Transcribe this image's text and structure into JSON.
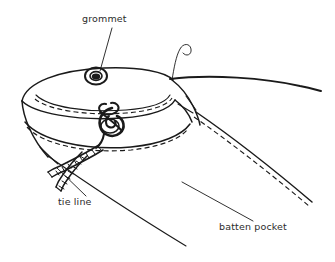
{
  "figure": {
    "name": "sail-batten-pocket-detail",
    "background_color": "#ffffff",
    "ink_color": "#1a1a1a",
    "label_color": "#2b2b2b",
    "width": 335,
    "height": 262
  },
  "labels": {
    "grommet": "grommet",
    "tie_line": "tie line",
    "batten_pocket": "batten pocket"
  },
  "callouts": [
    {
      "name": "grommet-leader",
      "label": "grommet",
      "from": [
        112,
        28
      ],
      "to": [
        100,
        72
      ]
    },
    {
      "name": "tie-line-leader",
      "label": "tie line",
      "from": [
        86,
        196
      ],
      "to": [
        57,
        168
      ]
    },
    {
      "name": "batten-pocket-leader",
      "label": "batten pocket",
      "from": [
        253,
        221
      ],
      "to": [
        182,
        182
      ]
    }
  ],
  "parts": {
    "grommet": {
      "name": "grommet-eyelet",
      "center": [
        96,
        76
      ],
      "outer_rx": 11,
      "outer_ry": 9,
      "inner_rx": 6,
      "inner_ry": 4.5
    },
    "knot": {
      "name": "tie-line-knot",
      "center": [
        111,
        122
      ],
      "description": "lashing knot tied through lower grommet"
    },
    "pocket_cuff": {
      "name": "batten-pocket-cuff",
      "description": "elliptical stitched band forming the pocket mouth"
    },
    "leech_hook": {
      "name": "leech-line-hook",
      "description": "thin curled line end above the pocket"
    }
  },
  "stitch_lines": {
    "count": 4,
    "style": "dashed",
    "description": "dashed stitch rows parallel to pocket seams"
  }
}
